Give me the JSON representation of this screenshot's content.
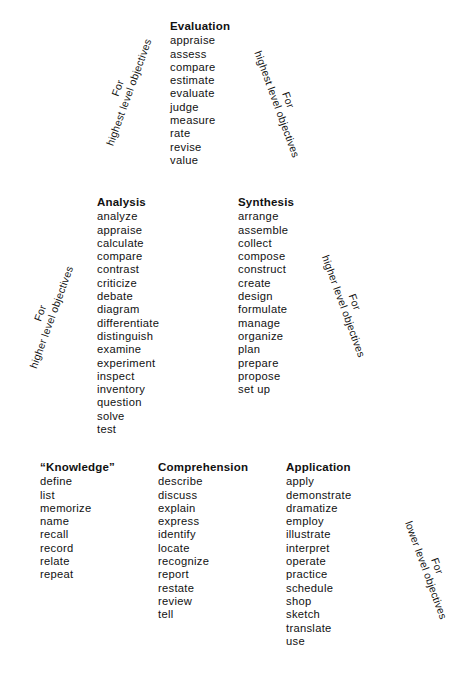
{
  "levels": {
    "evaluation": {
      "heading": "Evaluation",
      "verbs": [
        "appraise",
        "assess",
        "compare",
        "estimate",
        "evaluate",
        "judge",
        "measure",
        "rate",
        "revise",
        "value"
      ]
    },
    "analysis": {
      "heading": "Analysis",
      "verbs": [
        "analyze",
        "appraise",
        "calculate",
        "compare",
        "contrast",
        "criticize",
        "debate",
        "diagram",
        "differentiate",
        "distinguish",
        "examine",
        "experiment",
        "inspect",
        "inventory",
        "question",
        "solve",
        "test"
      ]
    },
    "synthesis": {
      "heading": "Synthesis",
      "verbs": [
        "arrange",
        "assemble",
        "collect",
        "compose",
        "construct",
        "create",
        "design",
        "formulate",
        "manage",
        "organize",
        "plan",
        "prepare",
        "propose",
        "set up"
      ]
    },
    "knowledge": {
      "heading": "“Knowledge”",
      "verbs": [
        "define",
        "list",
        "memorize",
        "name",
        "recall",
        "record",
        "relate",
        "repeat"
      ]
    },
    "comprehension": {
      "heading": "Comprehension",
      "verbs": [
        "describe",
        "discuss",
        "explain",
        "express",
        "identify",
        "locate",
        "recognize",
        "report",
        "restate",
        "review",
        "tell"
      ]
    },
    "application": {
      "heading": "Application",
      "verbs": [
        "apply",
        "demonstrate",
        "dramatize",
        "employ",
        "illustrate",
        "interpret",
        "operate",
        "practice",
        "schedule",
        "shop",
        "sketch",
        "translate",
        "use"
      ]
    }
  },
  "labels": {
    "highest_left": {
      "line1": "For",
      "line2": "highest level objectives"
    },
    "highest_right": {
      "line1": "For",
      "line2": "highest level objectives"
    },
    "higher_left": {
      "line1": "For",
      "line2": "higher level objectives"
    },
    "higher_right": {
      "line1": "For",
      "line2": "higher level objectives"
    },
    "lower_right": {
      "line1": "For",
      "line2": "lower level objectives"
    }
  }
}
